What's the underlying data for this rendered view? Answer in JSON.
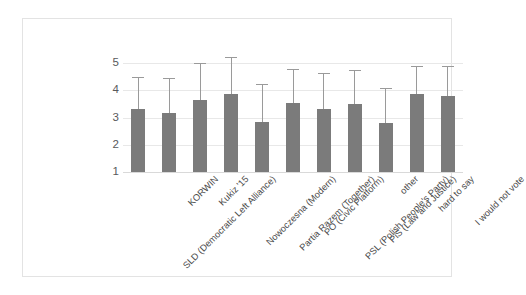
{
  "chart_data": {
    "type": "bar",
    "title": "",
    "subtitle": "",
    "xlabel": "",
    "ylabel": "",
    "ylim": [
      1,
      5
    ],
    "yticks": [
      1,
      2,
      3,
      4,
      5
    ],
    "grid": true,
    "legend": false,
    "legend_position": "none",
    "error_bars": "upper-only",
    "bar_color": "#7b7b7b",
    "error_bar_color": "#9a9a9a",
    "gridline_color": "#e8e8e8",
    "categories": [
      "SLD (Democratic Left Alliance)",
      "KORWIN",
      "Kukiz '15",
      "Nowoczesna (Modern)",
      "Partia Razem (Together)",
      "PO (Civic Platform)",
      "PSL (Polish People's Party)",
      "PiS (Law and Justice)",
      "other",
      "hard to say",
      "I would not vote"
    ],
    "values": [
      3.3,
      3.15,
      3.65,
      3.85,
      2.85,
      3.55,
      3.3,
      3.5,
      2.8,
      3.85,
      3.8
    ],
    "error_upper": [
      4.45,
      4.4,
      4.95,
      5.2,
      4.2,
      4.75,
      4.6,
      4.7,
      4.05,
      4.85,
      4.85
    ]
  }
}
